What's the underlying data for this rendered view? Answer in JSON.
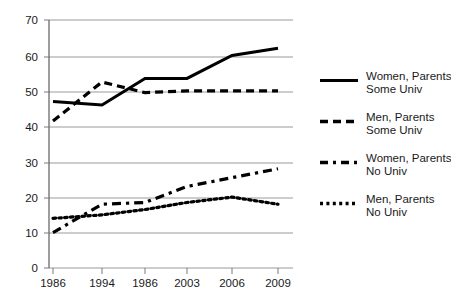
{
  "chart_data": {
    "type": "line",
    "title": "",
    "subtitle": "",
    "xlabel": "",
    "ylabel": "",
    "grid": true,
    "legend_position": "right",
    "x_tick_labels": [
      "1986",
      "1994",
      "1986",
      "2003",
      "2006",
      "2009"
    ],
    "y_tick_labels": [
      "0",
      "10",
      "20",
      "30",
      "40",
      "50",
      "60",
      "70"
    ],
    "y_ticks": [
      0,
      10,
      20,
      30,
      40,
      50,
      60,
      70
    ],
    "ylim": [
      0,
      70
    ],
    "x": [
      "1986",
      "1994",
      "1986",
      "2003",
      "2006",
      "2009"
    ],
    "series": [
      {
        "name": "Women, Parents Some Univ",
        "label_line1": "Women, Parents",
        "label_line2": "Some Univ",
        "style": "solid",
        "color": "#000000",
        "values": [
          47,
          46,
          53.5,
          53.5,
          60,
          62
        ]
      },
      {
        "name": "Men, Parents Some Univ",
        "label_line1": "Men, Parents",
        "label_line2": "Some Univ",
        "style": "dashed",
        "color": "#000000",
        "values": [
          41.5,
          52.5,
          49.5,
          50,
          50,
          50
        ]
      },
      {
        "name": "Women, Parents No Univ",
        "label_line1": "Women, Parents",
        "label_line2": "No Univ",
        "style": "dash-dot",
        "color": "#000000",
        "values": [
          10,
          18,
          18.5,
          23,
          25.5,
          28
        ]
      },
      {
        "name": "Men, Parents No Univ",
        "label_line1": "Men, Parents",
        "label_line2": "No Univ",
        "style": "dotted",
        "color": "#000000",
        "values": [
          14,
          15,
          16.5,
          18.5,
          20,
          18
        ]
      }
    ]
  },
  "axes": {
    "grid_color": "#9a9a9a",
    "axis_color": "#4d4d4d",
    "tick_color": "#7a7a7a"
  }
}
